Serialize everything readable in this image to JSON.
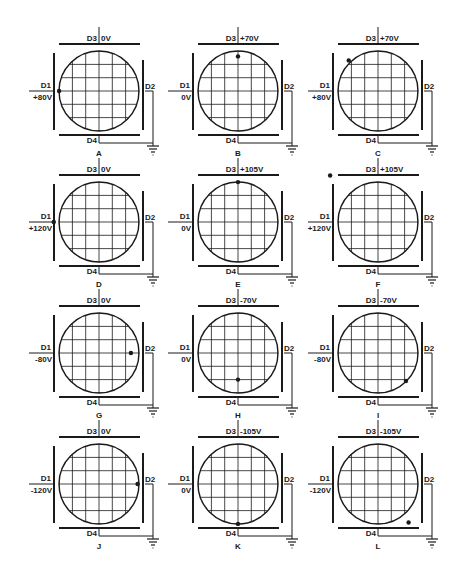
{
  "figure": {
    "grid_divisions": 6,
    "plate_labels": {
      "top": "D3",
      "bottom": "D4",
      "left": "D1",
      "right": "D2"
    }
  },
  "panels": [
    {
      "id": "A",
      "caption": "A",
      "d3_voltage": "0V",
      "d1_voltage": "+80V",
      "spot": {
        "x": -3.0,
        "y": 0.0
      }
    },
    {
      "id": "B",
      "caption": "B",
      "d3_voltage": "+70V",
      "d1_voltage": "0V",
      "spot": {
        "x": 0.0,
        "y": -2.6
      }
    },
    {
      "id": "C",
      "caption": "C",
      "d3_voltage": "+70V",
      "d1_voltage": "+80V",
      "spot": {
        "x": -2.2,
        "y": -2.3
      }
    },
    {
      "id": "D",
      "caption": "D",
      "d3_voltage": "0V",
      "d1_voltage": "+120V",
      "spot": {
        "x": -3.4,
        "y": 0.0
      }
    },
    {
      "id": "E",
      "caption": "E",
      "d3_voltage": "+105V",
      "d1_voltage": "0V",
      "spot": {
        "x": 0.0,
        "y": -3.0
      }
    },
    {
      "id": "F",
      "caption": "F",
      "d3_voltage": "+105V",
      "d1_voltage": "+120V",
      "spot": {
        "x": -3.6,
        "y": -3.5
      }
    },
    {
      "id": "G",
      "caption": "G",
      "d3_voltage": "0V",
      "d1_voltage": "-80V",
      "spot": {
        "x": 2.4,
        "y": 0.0
      }
    },
    {
      "id": "H",
      "caption": "H",
      "d3_voltage": "-70V",
      "d1_voltage": "0V",
      "spot": {
        "x": 0.0,
        "y": 2.0
      }
    },
    {
      "id": "I",
      "caption": "I",
      "d3_voltage": "-70V",
      "d1_voltage": "-80V",
      "spot": {
        "x": 2.1,
        "y": 2.1
      }
    },
    {
      "id": "J",
      "caption": "J",
      "d3_voltage": "0V",
      "d1_voltage": "-120V",
      "spot": {
        "x": 2.9,
        "y": 0.0
      }
    },
    {
      "id": "K",
      "caption": "K",
      "d3_voltage": "-105V",
      "d1_voltage": "0V",
      "spot": {
        "x": 0.0,
        "y": 3.0
      }
    },
    {
      "id": "L",
      "caption": "L",
      "d3_voltage": "-105V",
      "d1_voltage": "-120V",
      "spot": {
        "x": 2.3,
        "y": 2.9
      }
    }
  ],
  "colors": {
    "ink": "#1a1a1a",
    "background": "#ffffff"
  }
}
